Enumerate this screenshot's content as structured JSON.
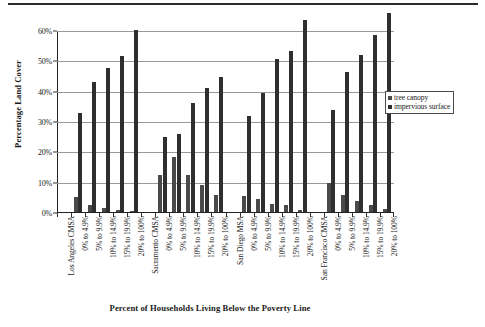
{
  "figure": {
    "has_top_rule": true
  },
  "chart_data": {
    "type": "bar",
    "title": "",
    "xlabel": "Percent of Households Living Below the Poverty Line",
    "ylabel": "Percentage Land Cover",
    "ylim": [
      0,
      60
    ],
    "ytick_labels": [
      "0%",
      "10%",
      "20%",
      "30%",
      "40%",
      "50%",
      "60%"
    ],
    "ytick_values": [
      0,
      10,
      20,
      30,
      40,
      50,
      60
    ],
    "grid": true,
    "legend_position": "right",
    "legend": [
      "tree canopy",
      "impervious surface"
    ],
    "group_labels": [
      "Los Angeles CMSA",
      "Sacramento CMSA",
      "San Diego MSA",
      "San Francisco CMSA"
    ],
    "categories": [
      "0% to 4.9%",
      "5% to 9.9%",
      "10% to 14.9%",
      "15% to 19.9%",
      "20% to 100%"
    ],
    "groups": [
      {
        "name": "Los Angeles CMSA",
        "categories": [
          "0% to 4.9%",
          "5% to 9.9%",
          "10% to 14.9%",
          "15% to 19.9%",
          "20% to 100%"
        ],
        "series": [
          {
            "name": "tree canopy",
            "values": [
              5.0,
              2.3,
              1.2,
              0.5,
              0.3
            ]
          },
          {
            "name": "impervious surface",
            "values": [
              32.8,
              42.7,
              47.6,
              51.5,
              60.1
            ]
          }
        ]
      },
      {
        "name": "Sacramento CMSA",
        "categories": [
          "0% to 4.9%",
          "5% to 9.9%",
          "10% to 14.9%",
          "15% to 19.9%",
          "20% to 100%"
        ],
        "series": [
          {
            "name": "tree canopy",
            "values": [
              12.1,
              18.2,
              12.3,
              8.8,
              5.7
            ]
          },
          {
            "name": "impervious surface",
            "values": [
              24.6,
              25.6,
              35.8,
              40.8,
              44.5
            ]
          }
        ]
      },
      {
        "name": "San Diego MSA",
        "categories": [
          "0% to 4.9%",
          "5% to 9.9%",
          "10% to 14.9%",
          "15% to 19.9%",
          "20% to 100%"
        ],
        "series": [
          {
            "name": "tree canopy",
            "values": [
              5.3,
              4.4,
              2.6,
              2.2,
              0.7
            ]
          },
          {
            "name": "impervious surface",
            "values": [
              31.8,
              39.3,
              50.6,
              53.1,
              63.3
            ]
          }
        ]
      },
      {
        "name": "San Francisco CMSA",
        "categories": [
          "0% to 4.9%",
          "5% to 9.9%",
          "10% to 14.9%",
          "15% to 19.9%",
          "20% to 100%"
        ],
        "series": [
          {
            "name": "tree canopy",
            "values": [
              9.5,
              5.7,
              3.5,
              2.3,
              1.0
            ]
          },
          {
            "name": "impervious surface",
            "values": [
              33.7,
              46.0,
              51.6,
              58.2,
              65.5
            ]
          }
        ]
      }
    ]
  },
  "colors": {
    "tree_canopy": "#4a4a4a",
    "impervious_surface": "#2f2f2f",
    "gridline": "#9a9a9a",
    "axis": "#222222"
  }
}
